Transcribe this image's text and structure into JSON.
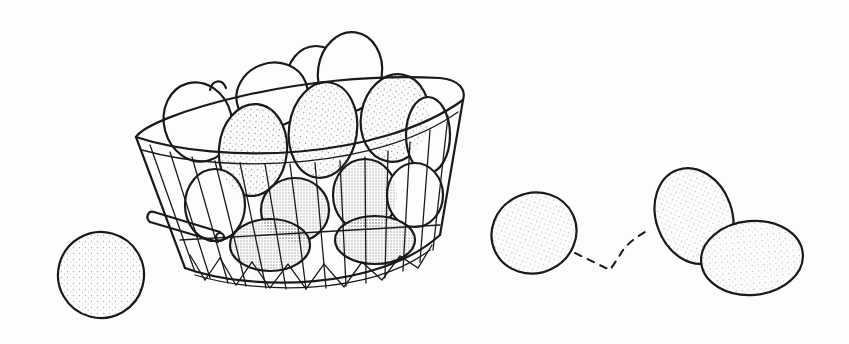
{
  "illustration": {
    "subject": "eggs in a wire basket",
    "style": "black stippled line art on white",
    "colors": {
      "background": "#fdfdfd",
      "ink": "#1a1a1a"
    },
    "elements": {
      "basket": "wire-basket",
      "loose_egg_left": "egg",
      "rolling_egg": "egg",
      "motion_trail": "dashed-path",
      "egg_pair_right": [
        "egg",
        "egg"
      ]
    }
  }
}
